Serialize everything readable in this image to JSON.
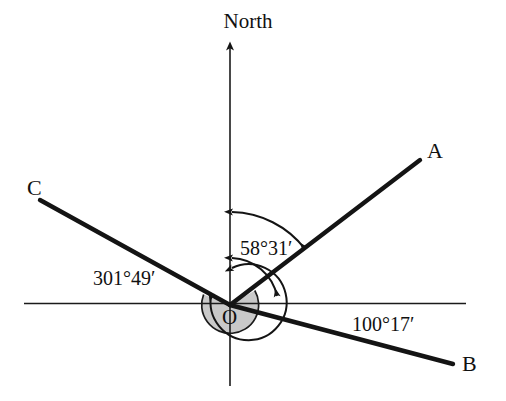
{
  "figure": {
    "type": "bearing-diagram",
    "background_color": "#ffffff",
    "ink_color": "#111111",
    "sector_fill_color": "#c9c9c9"
  },
  "labels": {
    "north": "North",
    "origin": "O",
    "point_a": "A",
    "point_b": "B",
    "point_c": "C"
  },
  "bearings": [
    {
      "id": "bearing-oa",
      "text": "58°31′",
      "degrees": 58,
      "minutes": 31,
      "from": "North",
      "to": "A"
    },
    {
      "id": "bearing-ob",
      "text": "100°17′",
      "degrees": 100,
      "minutes": 17,
      "from": "North",
      "to": "B"
    },
    {
      "id": "bearing-oc",
      "text": "301°49′",
      "degrees": 301,
      "minutes": 49,
      "from": "North",
      "to": "C"
    }
  ],
  "icons": {
    "north_arrow": "arrow-up-icon",
    "arc_arrow": "arc-arrowhead-icon"
  }
}
